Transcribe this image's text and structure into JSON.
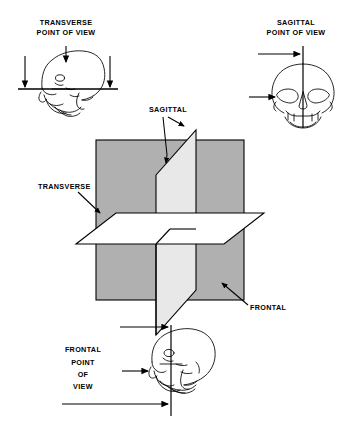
{
  "figure": {
    "title_fragment": "",
    "background_color": "#ffffff",
    "ink_color": "#000000",
    "plane_fill_gray": "#b0b0b0",
    "sagittal_fill_gray": "#e8e8e8",
    "transverse_fill": "#ffffff"
  },
  "panels": {
    "top_left": {
      "name": "transverse-point-of-view",
      "label_line1": "TRANSVERSE",
      "label_line2": "POINT OF VIEW",
      "skull": "lateral-skull-profile",
      "arrow_count": 3,
      "arrow_direction": "down"
    },
    "top_right": {
      "name": "sagittal-point-of-view",
      "label_line1": "SAGITTAL",
      "label_line2": "POINT OF VIEW",
      "skull": "anterior-skull",
      "arrow_count": 2,
      "arrow_direction": "right"
    },
    "bottom": {
      "name": "frontal-point-of-view",
      "label_line1": "FRONTAL",
      "label_line2": "POINT",
      "label_line3": "OF",
      "label_line4": "VIEW",
      "skull": "lateral-skull-profile",
      "arrow_count": 3,
      "arrow_direction": "right"
    }
  },
  "center_diagram": {
    "name": "three-anatomical-planes",
    "labels": {
      "sagittal": "SAGITTAL",
      "transverse": "TRANSVERSE",
      "frontal": "FRONTAL"
    },
    "planes": [
      {
        "id": "frontal",
        "label": "FRONTAL",
        "fill": "#b0b0b0",
        "orientation": "coronal-vertical-back"
      },
      {
        "id": "sagittal",
        "label": "SAGITTAL",
        "fill": "#e8e8e8",
        "orientation": "median-vertical"
      },
      {
        "id": "transverse",
        "label": "TRANSVERSE",
        "fill": "#ffffff",
        "orientation": "horizontal"
      }
    ]
  }
}
